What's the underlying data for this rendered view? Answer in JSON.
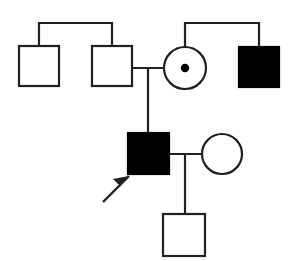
{
  "figure": {
    "kind": "pedigree-chart",
    "width": 299,
    "height": 261,
    "background_color": "#ffffff",
    "line_color": "#231f20",
    "fill_affected_color": "#000000",
    "fill_unaffected_color": "#ffffff",
    "line_width": 2.2
  },
  "legend_semantics": {
    "square": "male",
    "circle": "female",
    "filled": "affected",
    "open": "unaffected",
    "center_dot": "carrier",
    "arrow": "proband"
  },
  "individuals": [
    {
      "id": "I-1",
      "name": "generation1-male-unaffected-left",
      "shape": "square",
      "status": "unaffected",
      "generation": 1,
      "x": 19,
      "y": 46,
      "size": 40
    },
    {
      "id": "I-2",
      "name": "generation1-male-unaffected-father",
      "shape": "square",
      "status": "unaffected",
      "generation": 1,
      "x": 92,
      "y": 46,
      "size": 40
    },
    {
      "id": "I-3",
      "name": "generation1-female-carrier-mother",
      "shape": "circle",
      "status": "carrier",
      "generation": 1,
      "cx": 185,
      "cy": 68,
      "r": 21,
      "dot_r": 4.2
    },
    {
      "id": "I-4",
      "name": "generation1-male-affected-right",
      "shape": "square",
      "status": "affected",
      "generation": 1,
      "x": 239,
      "y": 47,
      "size": 40
    },
    {
      "id": "II-1",
      "name": "generation2-male-affected-proband",
      "shape": "square",
      "status": "affected",
      "generation": 2,
      "x": 128,
      "y": 133,
      "size": 41,
      "proband": true
    },
    {
      "id": "II-2",
      "name": "generation2-female-unaffected-spouse",
      "shape": "circle",
      "status": "unaffected",
      "generation": 2,
      "cx": 222,
      "cy": 154,
      "r": 20
    },
    {
      "id": "III-1",
      "name": "generation3-male-unaffected-child",
      "shape": "square",
      "status": "unaffected",
      "generation": 3,
      "x": 163,
      "y": 214,
      "size": 42
    }
  ],
  "connectors": [
    {
      "id": "sibship-bar-left",
      "name": "sibship-line-generation1-left",
      "type": "polyline",
      "points": "39,46 39,23 112,23 112,46"
    },
    {
      "id": "sibship-bar-right",
      "name": "sibship-line-generation1-right",
      "type": "polyline",
      "points": "185,47 185,23 259,23 259,47"
    },
    {
      "id": "mating-line-gen1",
      "name": "mating-line-generation1",
      "type": "line",
      "points": "131,68 164,68"
    },
    {
      "id": "descent-line-gen1-gen2",
      "name": "descent-line-to-proband",
      "type": "line",
      "points": "148,68 148,133"
    },
    {
      "id": "mating-line-gen2",
      "name": "mating-line-generation2",
      "type": "line",
      "points": "169,154 202,154"
    },
    {
      "id": "descent-line-gen2-gen3",
      "name": "descent-line-to-child",
      "type": "line",
      "points": "185,154 185,214"
    }
  ],
  "proband_arrow": {
    "name": "proband-arrow",
    "tail_x": 103,
    "tail_y": 202,
    "tip_x": 129,
    "tip_y": 176,
    "shaft_width": 2.4,
    "head_points": "129,176 113,179 120,186"
  }
}
